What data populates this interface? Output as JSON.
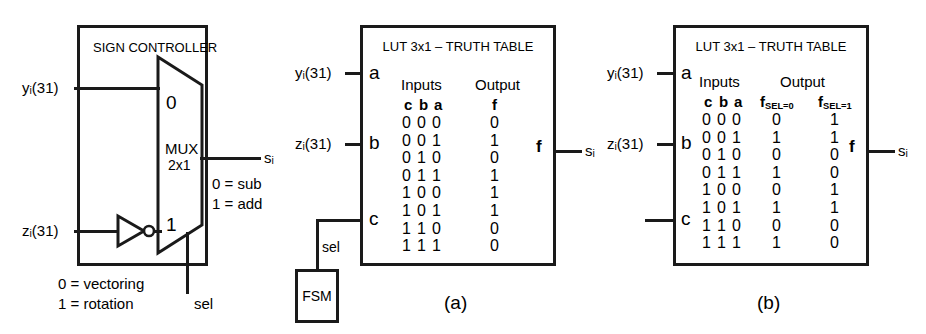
{
  "figure": {
    "caption_a": "(a)",
    "caption_b": "(b)"
  },
  "panel_left": {
    "title": "SIGN CONTROLLER",
    "mux": {
      "name": "MUX",
      "size": "2x1",
      "input_0_label": "0",
      "input_1_label": "1",
      "select_label": "sel"
    },
    "inputs": [
      {
        "name": "y",
        "sub": "i",
        "bits": "(31)",
        "text": "yᵢ(31)"
      },
      {
        "name": "z",
        "sub": "i",
        "bits": "(31)",
        "text": "zᵢ(31)"
      }
    ],
    "output": {
      "name": "s",
      "sub": "i",
      "text": "sᵢ"
    },
    "output_legend": [
      "0 = sub",
      "1 = add"
    ],
    "select_legend": [
      "0 = vectoring",
      "1 = rotation"
    ],
    "inverter_icon": "not-gate"
  },
  "panel_a": {
    "title": "LUT 3x1 – TRUTH TABLE",
    "pin_labels": {
      "a": "a",
      "b": "b",
      "c": "c",
      "f": "f"
    },
    "inputs": [
      {
        "text": "yᵢ(31)",
        "pin": "a"
      },
      {
        "text": "zᵢ(31)",
        "pin": "b"
      },
      {
        "text": "sel",
        "pin": "c"
      }
    ],
    "fsm_label": "FSM",
    "sel_label": "sel",
    "output": {
      "text": "sᵢ"
    },
    "table": {
      "group_headers": [
        "Inputs",
        "Output"
      ],
      "col_headers": [
        "c",
        "b",
        "a",
        "f"
      ],
      "rows": [
        {
          "c": "0",
          "b": "0",
          "a": "0",
          "f": "0"
        },
        {
          "c": "0",
          "b": "0",
          "a": "1",
          "f": "1"
        },
        {
          "c": "0",
          "b": "1",
          "a": "0",
          "f": "0"
        },
        {
          "c": "0",
          "b": "1",
          "a": "1",
          "f": "1"
        },
        {
          "c": "1",
          "b": "0",
          "a": "0",
          "f": "1"
        },
        {
          "c": "1",
          "b": "0",
          "a": "1",
          "f": "1"
        },
        {
          "c": "1",
          "b": "1",
          "a": "0",
          "f": "0"
        },
        {
          "c": "1",
          "b": "1",
          "a": "1",
          "f": "0"
        }
      ]
    }
  },
  "panel_b": {
    "title": "LUT 3x1 – TRUTH TABLE",
    "pin_labels": {
      "a": "a",
      "b": "b",
      "c": "c",
      "f": "f"
    },
    "inputs": [
      {
        "text": "yᵢ(31)",
        "pin": "a"
      },
      {
        "text": "zᵢ(31)",
        "pin": "b"
      },
      {
        "text": "",
        "pin": "c"
      }
    ],
    "output": {
      "text": "sᵢ"
    },
    "table": {
      "group_headers": [
        "Inputs",
        "Output"
      ],
      "col_headers": [
        "c",
        "b",
        "a"
      ],
      "out_headers": [
        {
          "base": "f",
          "sub": "SEL=0"
        },
        {
          "base": "f",
          "sub": "SEL=1"
        }
      ],
      "rows": [
        {
          "c": "0",
          "b": "0",
          "a": "0",
          "f0": "0",
          "f1": "1"
        },
        {
          "c": "0",
          "b": "0",
          "a": "1",
          "f0": "1",
          "f1": "1"
        },
        {
          "c": "0",
          "b": "1",
          "a": "0",
          "f0": "0",
          "f1": "0"
        },
        {
          "c": "0",
          "b": "1",
          "a": "1",
          "f0": "1",
          "f1": "0"
        },
        {
          "c": "1",
          "b": "0",
          "a": "0",
          "f0": "0",
          "f1": "1"
        },
        {
          "c": "1",
          "b": "0",
          "a": "1",
          "f0": "1",
          "f1": "1"
        },
        {
          "c": "1",
          "b": "1",
          "a": "0",
          "f0": "0",
          "f1": "0"
        },
        {
          "c": "1",
          "b": "1",
          "a": "1",
          "f0": "1",
          "f1": "0"
        }
      ]
    }
  },
  "colors": {
    "ink": "#1a1a1a",
    "background": "#ffffff"
  }
}
